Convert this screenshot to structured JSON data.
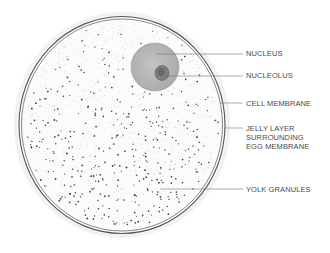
{
  "diagram": {
    "colors": {
      "outline": "#555555",
      "nucleus_fill": "#b8b8b8",
      "nucleolus_fill": "#7a7a7a",
      "label_text": "#4a4a4a",
      "leader_line": "#777777",
      "granule": "#444444"
    },
    "labels": [
      {
        "id": "nucleus",
        "lines": [
          "NUCLEUS"
        ]
      },
      {
        "id": "nucleolus",
        "lines": [
          "NUCLEOLUS"
        ]
      },
      {
        "id": "cell-membrane",
        "lines": [
          "CELL MEMBRANE"
        ]
      },
      {
        "id": "jelly-layer",
        "lines": [
          "JELLY LAYER",
          "SURROUNDING",
          "EGG MEMBRANE"
        ]
      },
      {
        "id": "yolk-granules",
        "lines": [
          "YOLK GRANULES"
        ]
      }
    ]
  }
}
